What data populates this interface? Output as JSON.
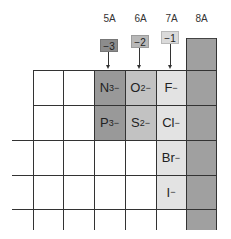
{
  "groups": [
    {
      "label": "5A",
      "charge": "−3",
      "color": "#999999",
      "badge_color": "#8c8c8c"
    },
    {
      "label": "6A",
      "charge": "−2",
      "color": "#c2c2c2",
      "badge_color": "#b8b8b8"
    },
    {
      "label": "7A",
      "charge": "−1",
      "color": "#e3e3e3",
      "badge_color": "#dadada"
    },
    {
      "label": "8A",
      "color": "#a0a0a0"
    }
  ],
  "ions": {
    "N": {
      "symbol": "N",
      "charge": "3−"
    },
    "O": {
      "symbol": "O",
      "charge": "2−"
    },
    "F": {
      "symbol": "F",
      "charge": "−"
    },
    "P": {
      "symbol": "P",
      "charge": "3−"
    },
    "S": {
      "symbol": "S",
      "charge": "2−"
    },
    "Cl": {
      "symbol": "Cl",
      "charge": "−"
    },
    "Br": {
      "symbol": "Br",
      "charge": "−"
    },
    "I": {
      "symbol": "I",
      "charge": "−"
    }
  }
}
